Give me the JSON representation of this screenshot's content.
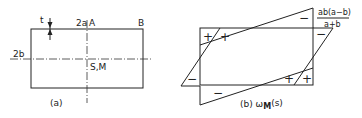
{
  "figure_a": {
    "caption": "(a)",
    "labels": {
      "thickness": "t",
      "width": "2a",
      "point_a": "A",
      "point_b": "B",
      "height": "2b",
      "center": "S,M"
    }
  },
  "figure_b": {
    "caption_prefix": "(b) ",
    "caption_symbol": "ω",
    "caption_subscript": "M",
    "caption_suffix": "(s)",
    "formula_numerator": "ab(a−b)",
    "formula_denominator": "a+b",
    "signs": {
      "top_left_1": "+",
      "top_left_2": "+",
      "top_right": "−",
      "right_upper": "−",
      "left_lower": "−",
      "bottom": "−",
      "bottom_right_1": "+",
      "bottom_right_2": "+"
    }
  }
}
